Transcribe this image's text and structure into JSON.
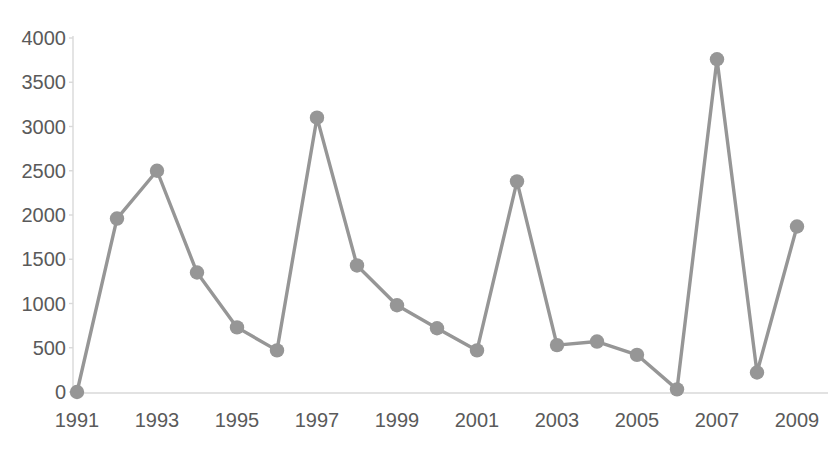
{
  "chart_data": {
    "type": "line",
    "title": "Number of items reported annually (partial)",
    "xlabel": "",
    "ylabel": "",
    "x": [
      1991,
      1992,
      1993,
      1994,
      1995,
      1996,
      1997,
      1998,
      1999,
      2000,
      2001,
      2002,
      2003,
      2004,
      2005,
      2006,
      2007,
      2008,
      2009
    ],
    "values": [
      0,
      1960,
      2500,
      1350,
      730,
      470,
      3100,
      1430,
      980,
      720,
      470,
      2380,
      530,
      570,
      420,
      30,
      3760,
      220,
      1870
    ],
    "series": [
      {
        "name": "series-1",
        "values": [
          0,
          1960,
          2500,
          1350,
          730,
          470,
          3100,
          1430,
          980,
          720,
          470,
          2380,
          530,
          570,
          420,
          30,
          3760,
          220,
          1870
        ],
        "color": "#969696"
      }
    ],
    "ylim": [
      0,
      4000
    ],
    "xlim": [
      1991,
      2009
    ],
    "y_ticks": [
      0,
      500,
      1000,
      1500,
      2000,
      2500,
      3000,
      3500,
      4000
    ],
    "y_tick_labels": [
      "0",
      "500",
      "1000",
      "1500",
      "2000",
      "2500",
      "3000",
      "3500",
      "4000"
    ],
    "x_ticks": [
      1991,
      1993,
      1995,
      1997,
      1999,
      2001,
      2003,
      2005,
      2007,
      2009
    ],
    "x_tick_labels": [
      "1991",
      "1993",
      "1995",
      "1997",
      "1999",
      "2001",
      "2003",
      "2005",
      "2007",
      "2009"
    ],
    "grid": false,
    "legend": "none",
    "marker": "circle",
    "marker_color": "#969696",
    "line_color": "#969696",
    "axis_color": "#d9d9d9"
  },
  "axes": {
    "y_labels": [
      "4000",
      "3500",
      "3000",
      "2500",
      "2000",
      "1500",
      "1000",
      "500",
      "0"
    ],
    "x_labels": [
      "1991",
      "1993",
      "1995",
      "1997",
      "1999",
      "2001",
      "2003",
      "2005",
      "2007",
      "2009"
    ]
  }
}
